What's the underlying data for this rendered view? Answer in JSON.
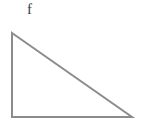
{
  "figure": {
    "background_color": "#ffffff",
    "label": {
      "text": "f",
      "color": "#3a3a3a",
      "x": 31,
      "y": 11
    },
    "shape": {
      "name": "right-triangle",
      "stroke_color": "#8c8c8c",
      "stroke_width": 2,
      "fill": "none",
      "vertices": [
        {
          "name": "top-left",
          "x": 12,
          "y": 33
        },
        {
          "name": "bottom-right",
          "x": 132,
          "y": 117
        },
        {
          "name": "bottom-left",
          "x": 12,
          "y": 117
        }
      ],
      "points_attr": "12,33 132,117 12,117",
      "edges": [
        {
          "name": "vertical-leg",
          "from": "top-left",
          "to": "bottom-left"
        },
        {
          "name": "horizontal-leg",
          "from": "bottom-left",
          "to": "bottom-right"
        },
        {
          "name": "hypotenuse",
          "from": "top-left",
          "to": "bottom-right"
        }
      ]
    }
  }
}
